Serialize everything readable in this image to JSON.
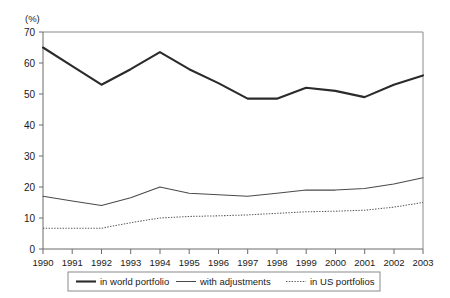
{
  "chart_data": {
    "type": "line",
    "title": "",
    "subtitle": "",
    "xlabel": "",
    "ylabel": "(%)",
    "ylim": [
      0,
      70
    ],
    "yticks": [
      0,
      10,
      20,
      30,
      40,
      50,
      60,
      70
    ],
    "grid": false,
    "legend_position": "bottom",
    "categories": [
      "1990",
      "1991",
      "1992",
      "1993",
      "1994",
      "1995",
      "1996",
      "1997",
      "1998",
      "1999",
      "2000",
      "2001",
      "2002",
      "2003"
    ],
    "series": [
      {
        "name": "in world portfolio",
        "style": "thick-solid",
        "color": "#2b2b2b",
        "values": [
          65,
          59,
          53,
          58,
          63.5,
          58,
          53.5,
          48.5,
          48.5,
          52,
          51,
          49,
          53,
          56
        ]
      },
      {
        "name": "with adjustments",
        "style": "thin-solid",
        "color": "#4a4a4a",
        "values": [
          17,
          15.5,
          14,
          16.5,
          20,
          18,
          17.5,
          17,
          18,
          19,
          19,
          19.5,
          21,
          23
        ]
      },
      {
        "name": "in US portfolios",
        "style": "dotted",
        "color": "#5a5a5a",
        "values": [
          6.7,
          6.7,
          6.7,
          8.5,
          10,
          10.5,
          10.7,
          11,
          11.5,
          12,
          12.2,
          12.5,
          13.5,
          15
        ]
      }
    ]
  },
  "axis": {
    "y_unit_label": "(%)",
    "y_tick_labels": [
      "70",
      "60",
      "50",
      "40",
      "30",
      "20",
      "10",
      "0"
    ],
    "x_tick_labels": [
      "1990",
      "1991",
      "1992",
      "1993",
      "1994",
      "1995",
      "1996",
      "1997",
      "1998",
      "1999",
      "2000",
      "2001",
      "2002",
      "2003"
    ]
  },
  "legend": {
    "items": [
      {
        "label": "in world portfolio",
        "style": "thick-solid"
      },
      {
        "label": "with adjustments",
        "style": "thin-solid"
      },
      {
        "label": "in US portfolios",
        "style": "dotted"
      }
    ]
  }
}
